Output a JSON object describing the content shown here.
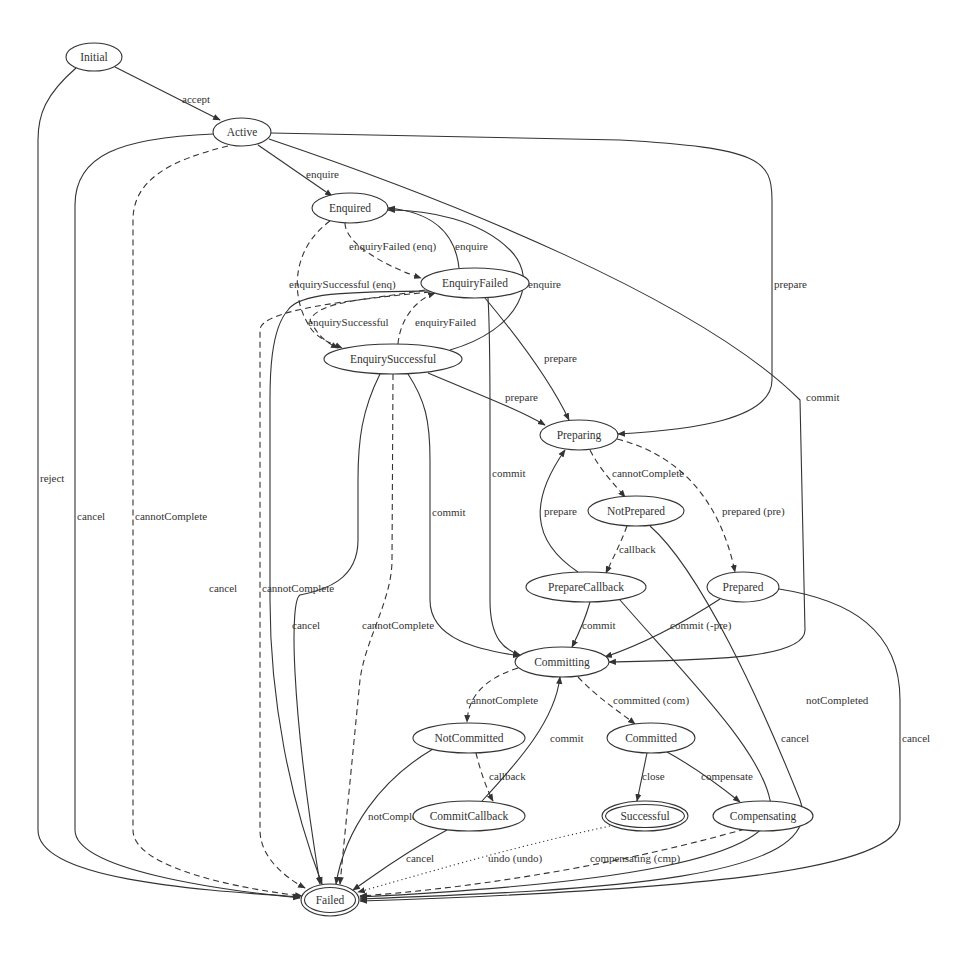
{
  "diagram": {
    "colors": {
      "stroke": "#333333",
      "background": "#ffffff",
      "text": "#333333"
    },
    "nodes": [
      {
        "id": "Initial",
        "label": "Initial",
        "cx": 94,
        "cy": 57,
        "rx": 28,
        "ry": 14,
        "double": false
      },
      {
        "id": "Active",
        "label": "Active",
        "cx": 242,
        "cy": 132,
        "rx": 29,
        "ry": 14,
        "double": false
      },
      {
        "id": "Enquired",
        "label": "Enquired",
        "cx": 350,
        "cy": 208,
        "rx": 38,
        "ry": 15,
        "double": false
      },
      {
        "id": "EnquiryFailed",
        "label": "EnquiryFailed",
        "cx": 475,
        "cy": 283,
        "rx": 54,
        "ry": 15,
        "double": false
      },
      {
        "id": "EnquirySuccessful",
        "label": "EnquirySuccessful",
        "cx": 393,
        "cy": 359,
        "rx": 69,
        "ry": 15,
        "double": false
      },
      {
        "id": "Preparing",
        "label": "Preparing",
        "cx": 579,
        "cy": 435,
        "rx": 39,
        "ry": 15,
        "double": false
      },
      {
        "id": "NotPrepared",
        "label": "NotPrepared",
        "cx": 636,
        "cy": 511,
        "rx": 48,
        "ry": 15,
        "double": false
      },
      {
        "id": "PrepareCallback",
        "label": "PrepareCallback",
        "cx": 586,
        "cy": 587,
        "rx": 60,
        "ry": 15,
        "double": false
      },
      {
        "id": "Prepared",
        "label": "Prepared",
        "cx": 743,
        "cy": 587,
        "rx": 36,
        "ry": 15,
        "double": false
      },
      {
        "id": "Committing",
        "label": "Committing",
        "cx": 562,
        "cy": 662,
        "rx": 47,
        "ry": 15,
        "double": false
      },
      {
        "id": "NotCommitted",
        "label": "NotCommitted",
        "cx": 469,
        "cy": 738,
        "rx": 56,
        "ry": 15,
        "double": false
      },
      {
        "id": "Committed",
        "label": "Committed",
        "cx": 651,
        "cy": 738,
        "rx": 44,
        "ry": 15,
        "double": false
      },
      {
        "id": "CommitCallback",
        "label": "CommitCallback",
        "cx": 469,
        "cy": 816,
        "rx": 56,
        "ry": 15,
        "double": false
      },
      {
        "id": "Successful",
        "label": "Successful",
        "cx": 645,
        "cy": 816,
        "rx": 43,
        "ry": 15,
        "double": true
      },
      {
        "id": "Compensating",
        "label": "Compensating",
        "cx": 763,
        "cy": 816,
        "rx": 50,
        "ry": 15,
        "double": false
      },
      {
        "id": "Failed",
        "label": "Failed",
        "cx": 330,
        "cy": 900,
        "rx": 29,
        "ry": 16,
        "double": true
      }
    ],
    "edges": [
      {
        "from": "Initial",
        "to": "Active",
        "label": "accept",
        "style": "solid",
        "d": "M 115 67 L 220 120",
        "lx": 182,
        "ly": 99
      },
      {
        "from": "Initial",
        "to": "Failed",
        "label": "reject",
        "style": "solid",
        "d": "M 76 68 C 45 95 38 115 38 140 L 38 830 C 38 880 200 890 300 897",
        "lx": 40,
        "ly": 478
      },
      {
        "from": "Active",
        "to": "Enquired",
        "label": "enquire",
        "style": "solid",
        "d": "M 258 145 L 332 196",
        "lx": 306,
        "ly": 174
      },
      {
        "from": "Active",
        "to": "Failed",
        "label": "cancel",
        "style": "solid",
        "d": "M 213 134 C 120 138 75 155 75 205 L 75 830 C 75 870 220 890 300 898",
        "lx": 77,
        "ly": 516
      },
      {
        "from": "Active",
        "to": "Failed",
        "label": "cannotComplete",
        "style": "dashed",
        "d": "M 228 146 C 170 160 133 180 133 220 L 133 830 C 133 870 250 890 302 896",
        "lx": 135,
        "ly": 516
      },
      {
        "from": "Active",
        "to": "Preparing",
        "label": "prepare",
        "style": "solid",
        "d": "M 271 133 L 620 140 C 760 148 772 160 772 200 L 772 380 C 772 420 690 430 618 434",
        "lx": 774,
        "ly": 284
      },
      {
        "from": "Active",
        "to": "Committing",
        "label": "commit",
        "style": "solid",
        "d": "M 269 139 C 450 200 700 300 800 400 L 805 630 C 805 660 700 660 609 662",
        "lx": 806,
        "ly": 397
      },
      {
        "from": "Enquired",
        "to": "EnquiryFailed",
        "label": "enquiryFailed (enq)",
        "style": "dashed",
        "d": "M 345 223 C 345 245 390 268 421 278",
        "lx": 349,
        "ly": 246
      },
      {
        "from": "Enquired",
        "to": "EnquirySuccessful",
        "label": "enquirySuccessful (enq)",
        "style": "dashed",
        "d": "M 330 221 C 290 250 290 300 312 330 C 320 340 335 345 342 348",
        "lx": 289,
        "ly": 284
      },
      {
        "from": "EnquiryFailed",
        "to": "Enquired",
        "label": "enquire",
        "style": "solid",
        "d": "M 459 268 C 455 230 430 212 388 208",
        "lx": 455,
        "ly": 246
      },
      {
        "from": "EnquirySuccessful",
        "to": "Enquired",
        "label": "enquire",
        "style": "solid",
        "d": "M 450 350 C 520 330 540 280 510 250 C 480 220 430 210 388 210",
        "lx": 528,
        "ly": 284
      },
      {
        "from": "EnquirySuccessful",
        "to": "EnquiryFailed",
        "label": "enquiryFailed",
        "style": "dashed",
        "d": "M 398 344 C 400 320 415 300 435 293",
        "lx": 415,
        "ly": 322
      },
      {
        "from": "EnquiryFailed",
        "to": "EnquirySuccessful",
        "label": "enquirySuccessful",
        "style": "dashed",
        "d": "M 425 290 C 370 300 320 300 310 320 C 320 340 330 344 338 348",
        "lx": 308,
        "ly": 322
      },
      {
        "from": "EnquiryFailed",
        "to": "Preparing",
        "label": "prepare",
        "style": "solid",
        "d": "M 485 298 C 520 340 550 380 569 420",
        "lx": 544,
        "ly": 358
      },
      {
        "from": "EnquiryFailed",
        "to": "Committing",
        "label": "commit",
        "style": "solid",
        "d": "M 488 298 C 490 330 490 380 490 420 L 490 600 C 490 640 505 650 520 655",
        "lx": 492,
        "ly": 473
      },
      {
        "from": "EnquiryFailed",
        "to": "Failed",
        "label": "cancel",
        "style": "solid",
        "d": "M 428 291 C 350 292 300 292 288 310 C 270 330 270 380 270 400 L 270 600 C 270 700 290 800 322 884",
        "lx": 209,
        "ly": 588
      },
      {
        "from": "EnquiryFailed",
        "to": "Failed",
        "label": "cannotComplete",
        "style": "dashed",
        "d": "M 430 292 C 350 300 260 310 260 330 L 260 830 C 260 860 290 880 305 888",
        "lx": 262,
        "ly": 588
      },
      {
        "from": "EnquirySuccessful",
        "to": "Preparing",
        "label": "prepare",
        "style": "solid",
        "d": "M 428 373 C 480 395 520 410 545 425",
        "lx": 505,
        "ly": 397
      },
      {
        "from": "EnquirySuccessful",
        "to": "Committing",
        "label": "commit",
        "style": "solid",
        "d": "M 408 374 C 425 400 430 420 430 460 L 430 600 C 430 640 480 650 520 656",
        "lx": 432,
        "ly": 512
      },
      {
        "from": "EnquirySuccessful",
        "to": "Failed",
        "label": "cancel",
        "style": "solid",
        "d": "M 380 374 C 362 410 358 440 358 480 L 358 540 C 358 580 325 590 300 595 C 290 600 290 700 320 884",
        "lx": 292,
        "ly": 625
      },
      {
        "from": "EnquirySuccessful",
        "to": "Failed",
        "label": "cannotComplete",
        "style": "dashed",
        "d": "M 393 374 L 392 560 C 392 600 365 640 360 680 L 340 884",
        "lx": 362,
        "ly": 625
      },
      {
        "from": "Preparing",
        "to": "NotPrepared",
        "label": "cannotComplete",
        "style": "dashed",
        "d": "M 590 450 C 600 470 615 485 625 497",
        "lx": 612,
        "ly": 473
      },
      {
        "from": "Preparing",
        "to": "Prepared",
        "label": "prepared (pre)",
        "style": "dashed",
        "d": "M 617 439 C 680 455 720 500 735 572",
        "lx": 722,
        "ly": 511
      },
      {
        "from": "PrepareCallback",
        "to": "Preparing",
        "label": "prepare",
        "style": "solid",
        "d": "M 578 572 C 530 540 530 500 565 450",
        "lx": 544,
        "ly": 511
      },
      {
        "from": "NotPrepared",
        "to": "PrepareCallback",
        "label": "callback",
        "style": "dashed",
        "d": "M 627 526 C 620 545 612 560 606 573",
        "lx": 619,
        "ly": 549
      },
      {
        "from": "NotPrepared",
        "to": "Failed",
        "label": "notCompleted",
        "style": "solid",
        "d": "M 650 526 C 700 570 760 700 800 800 C 830 880 600 890 360 899",
        "lx": 806,
        "ly": 700
      },
      {
        "from": "PrepareCallback",
        "to": "Committing",
        "label": "commit",
        "style": "solid",
        "d": "M 590 602 C 585 620 578 635 572 647",
        "lx": 582,
        "ly": 625
      },
      {
        "from": "PrepareCallback",
        "to": "Failed",
        "label": "cancel",
        "style": "solid",
        "d": "M 620 600 C 690 680 760 750 770 800 C 790 860 600 885 360 897",
        "lx": 781,
        "ly": 738
      },
      {
        "from": "Prepared",
        "to": "Committing",
        "label": "commit (-pre)",
        "style": "solid",
        "d": "M 720 599 C 680 625 640 645 605 657",
        "lx": 670,
        "ly": 625
      },
      {
        "from": "Prepared",
        "to": "Failed",
        "label": "cancel",
        "style": "solid",
        "d": "M 779 589 C 850 600 900 630 900 700 L 900 820 C 900 870 700 890 360 901",
        "lx": 902,
        "ly": 738
      },
      {
        "from": "Committing",
        "to": "NotCommitted",
        "label": "cannotComplete",
        "style": "dashed",
        "d": "M 518 668 C 480 680 468 700 467 722",
        "lx": 466,
        "ly": 700
      },
      {
        "from": "Committing",
        "to": "Committed",
        "label": "committed (com)",
        "style": "dashed",
        "d": "M 578 677 C 600 700 620 712 635 724",
        "lx": 613,
        "ly": 700
      },
      {
        "from": "CommitCallback",
        "to": "Committing",
        "label": "commit",
        "style": "solid",
        "d": "M 482 801 C 520 760 555 720 560 677",
        "lx": 550,
        "ly": 738
      },
      {
        "from": "NotCommitted",
        "to": "CommitCallback",
        "label": "callback",
        "style": "dashed",
        "d": "M 476 753 C 480 770 487 790 493 801",
        "lx": 489,
        "ly": 776
      },
      {
        "from": "NotCommitted",
        "to": "Failed",
        "label": "notCompleted",
        "style": "solid",
        "d": "M 433 749 C 380 780 345 830 336 884",
        "lx": 368,
        "ly": 816
      },
      {
        "from": "Committed",
        "to": "Successful",
        "label": "close",
        "style": "solid",
        "d": "M 647 753 L 637 801",
        "lx": 642,
        "ly": 776
      },
      {
        "from": "Committed",
        "to": "Compensating",
        "label": "compensate",
        "style": "solid",
        "d": "M 667 752 C 700 770 725 790 740 802",
        "lx": 701,
        "ly": 776
      },
      {
        "from": "CommitCallback",
        "to": "Failed",
        "label": "cancel",
        "style": "solid",
        "d": "M 447 830 C 400 855 375 875 353 890",
        "lx": 406,
        "ly": 858
      },
      {
        "from": "Successful",
        "to": "Failed",
        "label": "undo (undo)",
        "style": "dotted",
        "d": "M 610 826 C 500 850 420 875 358 892",
        "lx": 488,
        "ly": 858
      },
      {
        "from": "Compensating",
        "to": "Failed",
        "label": "compensating (cmp)",
        "style": "dashed",
        "d": "M 745 829 C 600 870 450 890 360 896",
        "lx": 590,
        "ly": 858
      }
    ]
  }
}
